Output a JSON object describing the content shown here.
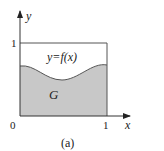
{
  "figure": {
    "caption": "(a)",
    "function_label": "y=f(x)",
    "region_label": "G",
    "axes": {
      "x_label": "x",
      "y_label": "y",
      "origin_label": "0",
      "x_tick_label": "1",
      "y_tick_label": "1"
    },
    "colors": {
      "fill": "#c8c8c8",
      "stroke": "#555555",
      "background": "#ffffff"
    }
  }
}
